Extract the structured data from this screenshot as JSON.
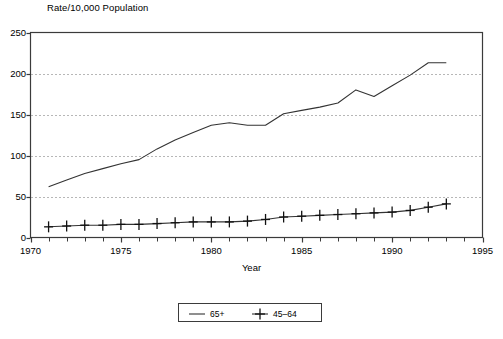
{
  "chart_data": {
    "type": "line",
    "title": "",
    "ylabel": "Rate/10,000 Population",
    "xlabel": "Year",
    "xlim": [
      1970,
      1995
    ],
    "ylim": [
      0,
      250
    ],
    "xticks": [
      1970,
      1975,
      1980,
      1985,
      1990,
      1995
    ],
    "yticks": [
      0,
      50,
      100,
      150,
      200,
      250
    ],
    "grid": "horizontal-dotted",
    "legend_position": "below-center",
    "x": [
      1971,
      1972,
      1973,
      1974,
      1975,
      1976,
      1977,
      1978,
      1979,
      1980,
      1981,
      1982,
      1983,
      1984,
      1985,
      1986,
      1987,
      1988,
      1989,
      1990,
      1991,
      1992,
      1993
    ],
    "series": [
      {
        "name": "65+",
        "marker": "none",
        "values": [
          62,
          70,
          78,
          84,
          90,
          95,
          108,
          119,
          128,
          137,
          140,
          137,
          137,
          151,
          155,
          159,
          164,
          180,
          172,
          185,
          198,
          213,
          213
        ]
      },
      {
        "name": "45–64",
        "marker": "plus",
        "values": [
          13,
          14,
          15,
          15,
          16,
          16,
          17,
          18,
          19,
          19,
          19,
          20,
          22,
          25,
          26,
          27,
          28,
          29,
          30,
          31,
          33,
          37,
          41
        ]
      }
    ]
  },
  "axes": {
    "y_title": "Rate/10,000 Population",
    "x_title": "Year",
    "y_tick_labels": [
      "250",
      "200",
      "150",
      "100",
      "50",
      "0"
    ],
    "x_tick_labels": [
      "1970",
      "1975",
      "1980",
      "1985",
      "1990",
      "1995"
    ]
  },
  "legend": {
    "items": [
      {
        "label": "65+",
        "marker": "line-only"
      },
      {
        "label": "45–64",
        "marker": "line-plus"
      }
    ]
  },
  "colors": {
    "line": "#333333",
    "frame": "#3b3b3b",
    "grid": "#6e6e6e",
    "background": "#ffffff"
  }
}
